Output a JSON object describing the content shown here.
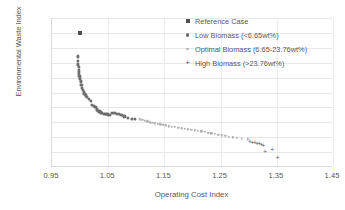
{
  "chart_data": {
    "type": "scatter",
    "title": "",
    "xlabel": "Operating Cost Index",
    "ylabel": "Environmental Waste Index",
    "xlim": [
      0.95,
      1.45
    ],
    "ylim": [
      0.82,
      1.02
    ],
    "xticks": [
      "0.95",
      "1.05",
      "1.15",
      "1.25",
      "1.35",
      "1.45"
    ],
    "xtick_values": [
      0.95,
      1.05,
      1.15,
      1.25,
      1.35,
      1.45
    ],
    "yticks": [
      "0.82",
      "0.84",
      "0.86",
      "0.88",
      "0.9",
      "0.92",
      "0.94",
      "0.96",
      "0.98",
      "1",
      "1.02"
    ],
    "ytick_values": [
      0.82,
      0.84,
      0.86,
      0.88,
      0.9,
      0.92,
      0.94,
      0.96,
      0.98,
      1.0,
      1.02
    ],
    "grid": true,
    "legend_position": "top-right",
    "series": [
      {
        "name": "Reference Case",
        "marker": "square",
        "color": "#4f4f4f",
        "points": [
          [
            1.0,
            1.0
          ]
        ]
      },
      {
        "name": "Low Biomass (<6.65wt%)",
        "marker": "circle",
        "color": "#6e6e6e",
        "points": [
          [
            0.9955,
            0.9685
          ],
          [
            0.9962,
            0.9625
          ],
          [
            0.9968,
            0.9578
          ],
          [
            0.9972,
            0.954
          ],
          [
            0.9976,
            0.9508
          ],
          [
            0.998,
            0.9478
          ],
          [
            0.9984,
            0.9452
          ],
          [
            0.9988,
            0.9428
          ],
          [
            0.9993,
            0.94
          ],
          [
            0.9998,
            0.9382
          ],
          [
            1.001,
            0.9348
          ],
          [
            1.0022,
            0.93
          ],
          [
            1.0035,
            0.9262
          ],
          [
            1.0048,
            0.9232
          ],
          [
            1.0062,
            0.9208
          ],
          [
            1.0078,
            0.9185
          ],
          [
            1.0098,
            0.9162
          ],
          [
            1.0118,
            0.914
          ],
          [
            1.0152,
            0.911
          ],
          [
            1.0188,
            0.909
          ],
          [
            1.0215,
            0.9032
          ],
          [
            1.0252,
            0.9018
          ],
          [
            1.0272,
            0.9005
          ],
          [
            1.0298,
            0.8972
          ],
          [
            1.0322,
            0.8958
          ],
          [
            1.0345,
            0.8945
          ],
          [
            1.0368,
            0.8932
          ],
          [
            1.0392,
            0.8925
          ],
          [
            1.0418,
            0.8918
          ],
          [
            1.0442,
            0.8912
          ],
          [
            1.0468,
            0.8908
          ],
          [
            1.0495,
            0.8905
          ],
          [
            1.0525,
            0.89
          ],
          [
            1.0572,
            0.8928
          ],
          [
            1.061,
            0.8922
          ],
          [
            1.0648,
            0.8915
          ],
          [
            1.069,
            0.8908
          ],
          [
            1.0735,
            0.89
          ],
          [
            1.079,
            0.888
          ],
          [
            1.085,
            0.8862
          ],
          [
            1.092,
            0.8848
          ],
          [
            1.0982,
            0.8845
          ]
        ]
      },
      {
        "name": "Optimal Biomass (6.65-23.76wt%)",
        "marker": "circle-small",
        "color": "#b3b3b3",
        "points": [
          [
            1.106,
            0.8838
          ],
          [
            1.1105,
            0.8832
          ],
          [
            1.115,
            0.8822
          ],
          [
            1.1195,
            0.8812
          ],
          [
            1.124,
            0.8802
          ],
          [
            1.1285,
            0.8792
          ],
          [
            1.133,
            0.8786
          ],
          [
            1.1378,
            0.878
          ],
          [
            1.1428,
            0.8772
          ],
          [
            1.1478,
            0.8764
          ],
          [
            1.1528,
            0.8758
          ],
          [
            1.158,
            0.8748
          ],
          [
            1.1632,
            0.8742
          ],
          [
            1.169,
            0.8736
          ],
          [
            1.1748,
            0.8728
          ],
          [
            1.1805,
            0.8722
          ],
          [
            1.1862,
            0.8714
          ],
          [
            1.192,
            0.8706
          ],
          [
            1.1978,
            0.87
          ],
          [
            1.2038,
            0.8692
          ],
          [
            1.2098,
            0.8686
          ],
          [
            1.2158,
            0.8678
          ],
          [
            1.2218,
            0.867
          ],
          [
            1.2278,
            0.8662
          ],
          [
            1.2338,
            0.8652
          ],
          [
            1.2398,
            0.8644
          ],
          [
            1.2458,
            0.8634
          ],
          [
            1.2518,
            0.8626
          ],
          [
            1.2582,
            0.8618
          ],
          [
            1.2648,
            0.8608
          ],
          [
            1.2718,
            0.8598
          ],
          [
            1.2792,
            0.8588
          ],
          [
            1.2878,
            0.858
          ],
          [
            1.298,
            0.8572
          ]
        ]
      },
      {
        "name": "High Biomass (>23.76wt%)",
        "marker": "plus",
        "color": "#595959",
        "points": [
          [
            1.302,
            0.8548
          ],
          [
            1.3068,
            0.8542
          ],
          [
            1.311,
            0.8535
          ],
          [
            1.3152,
            0.8528
          ],
          [
            1.3192,
            0.852
          ],
          [
            1.3228,
            0.8508
          ],
          [
            1.3262,
            0.8492
          ],
          [
            1.3295,
            0.8418
          ],
          [
            1.3418,
            0.8442
          ],
          [
            1.3515,
            0.8335
          ]
        ]
      }
    ]
  },
  "axes": {
    "y_title": "Environmental Waste Index",
    "x_title": "Operating Cost Index"
  },
  "legend": {
    "items": [
      {
        "label": "Reference Case",
        "marker": "square-marker"
      },
      {
        "label": "Low Biomass (<6.65wt%)",
        "marker": "circle-marker"
      },
      {
        "label": "Optimal Biomass (6.65-23.76wt%)",
        "marker": "small-circle-marker"
      },
      {
        "label": "High Biomass (>23.76wt%)",
        "marker": "plus-marker"
      }
    ]
  }
}
